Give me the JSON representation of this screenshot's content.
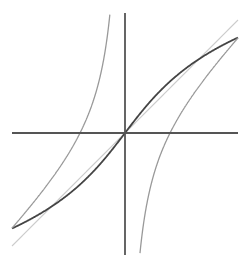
{
  "figure": {
    "width": 252,
    "height": 269,
    "background": "#ffffff",
    "origin_px": [
      125,
      133
    ],
    "scale_px_per_unit": 45,
    "x_range": [
      -2.5,
      2.5
    ],
    "y_range": [
      -2.7,
      2.7
    ]
  },
  "axes": {
    "color": "#555555",
    "stroke_width": 1.8,
    "x_axis": {
      "x1": 12,
      "x2": 238,
      "y": 133
    },
    "y_axis": {
      "x": 125,
      "y1": 13,
      "y2": 255
    }
  },
  "curves": [
    {
      "name": "identity-line",
      "expr": "y = x",
      "color": "#cccccc",
      "stroke_width": 1.2
    },
    {
      "name": "dark-sigmoid-curve",
      "expr": "y = asinh-like(x)",
      "color": "#444444",
      "stroke_width": 1.8
    },
    {
      "name": "hyperbola-left-branch",
      "expr": "y = x - 1/x, x<0",
      "color": "#999999",
      "stroke_width": 1.3
    },
    {
      "name": "hyperbola-right-branch",
      "expr": "y = x - 1/x, x>0",
      "color": "#999999",
      "stroke_width": 1.3
    }
  ]
}
